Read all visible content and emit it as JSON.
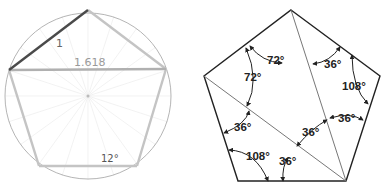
{
  "left_figure": {
    "title": "Pentagon inscribed in circle",
    "labels": {
      "side": "1",
      "diagonal": "1.618",
      "angle": "12°"
    },
    "colors": {
      "circle": "#b5b5b5",
      "pentagon": "#c4c4c4",
      "highlight_side": "#4a4a4a",
      "rays": "#ececec"
    }
  },
  "right_figure": {
    "title": "Pentagon angles",
    "angles": [
      {
        "id": "top-left-outer",
        "text": "72°"
      },
      {
        "id": "top-left-inner",
        "text": "72°"
      },
      {
        "id": "top-right",
        "text": "36°"
      },
      {
        "id": "right-vertex",
        "text": "108°"
      },
      {
        "id": "right-lower",
        "text": "36°"
      },
      {
        "id": "center",
        "text": "36°"
      },
      {
        "id": "left-mid",
        "text": "36°"
      },
      {
        "id": "bottom-left",
        "text": "108°"
      },
      {
        "id": "bottom-mid",
        "text": "36°"
      }
    ],
    "colors": {
      "outline": "#222222",
      "diagonal": "#777777",
      "text": "#222222"
    }
  }
}
